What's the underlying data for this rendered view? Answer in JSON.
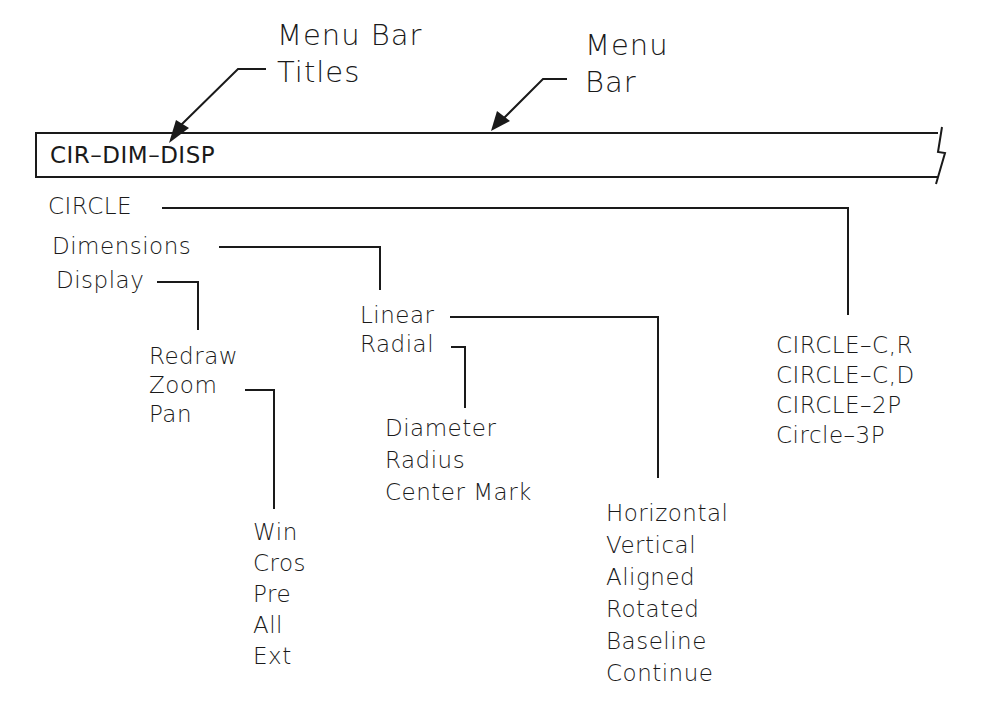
{
  "annotations": {
    "menu_bar_titles": {
      "line1": "Menu  Bar",
      "line2": "Titles"
    },
    "menu_bar": {
      "line1": "Menu",
      "line2": "Bar"
    }
  },
  "menu_bar": {
    "title": "CIR–DIM–DISP"
  },
  "menus": {
    "top_level": [
      {
        "label": "CIRCLE"
      },
      {
        "label": "Dimensions"
      },
      {
        "label": "Display"
      }
    ],
    "circle_submenu": [
      {
        "label": "CIRCLE–C,R"
      },
      {
        "label": "CIRCLE–C,D"
      },
      {
        "label": "CIRCLE–2P"
      },
      {
        "label": "Circle–3P"
      }
    ],
    "dimensions_submenu": [
      {
        "label": "Linear"
      },
      {
        "label": "Radial"
      }
    ],
    "linear_submenu": [
      {
        "label": "Horizontal"
      },
      {
        "label": "Vertical"
      },
      {
        "label": "Aligned"
      },
      {
        "label": "Rotated"
      },
      {
        "label": "Baseline"
      },
      {
        "label": "Continue"
      }
    ],
    "radial_submenu": [
      {
        "label": "Diameter"
      },
      {
        "label": "Radius"
      },
      {
        "label": "Center  Mark"
      }
    ],
    "display_submenu": [
      {
        "label": "Redraw"
      },
      {
        "label": "Zoom"
      },
      {
        "label": "Pan"
      }
    ],
    "zoom_submenu": [
      {
        "label": "Win"
      },
      {
        "label": "Cros"
      },
      {
        "label": "Pre"
      },
      {
        "label": "All"
      },
      {
        "label": "Ext"
      }
    ]
  },
  "colors": {
    "ink": "#1a1a1a",
    "background": "#ffffff"
  }
}
